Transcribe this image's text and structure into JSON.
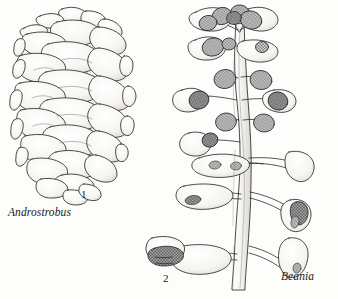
{
  "figure": {
    "kind": "scientific-illustration",
    "medium": "pen-and-ink stipple line drawing",
    "background_color": "#fdfdfb",
    "ink_color": "#1a1a1a",
    "panels": [
      {
        "number": "1",
        "taxon": "Androstrobus",
        "description": "ovoid pollen cone with helically arranged overlapping peltate microsporophylls, stippled shading beneath each scale"
      },
      {
        "number": "2",
        "taxon": "Beania",
        "description": "loose ovulate cone: slender central axis bearing spreading peltate megasporophyll stalks, each with a pair of pendant ovules rendered as cross-hatched gray ovals"
      }
    ]
  },
  "labels": {
    "androstrobus": "Androstrobus",
    "beania": "Beania",
    "fig_one": "1",
    "fig_two": "2"
  },
  "palette": {
    "paper": "#fdfdfb",
    "ink": "#1a1a1a",
    "outline": "#2a2a2a",
    "scale_fill": "#f7f6f2",
    "scale_shadow": "#b9b4ab",
    "ovule_fill": "#9b9b9b",
    "ovule_dark": "#6f6f6f",
    "stalk_fill": "#f4f3ef",
    "axis_fill": "#f2f1ec"
  }
}
